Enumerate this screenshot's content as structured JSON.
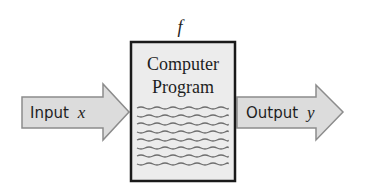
{
  "diagram": {
    "function_label": "f",
    "box": {
      "line1": "Computer",
      "line2": "Program",
      "code_lines": 8
    },
    "input_arrow": {
      "text": "Input",
      "variable": "x"
    },
    "output_arrow": {
      "text": "Output",
      "variable": "y"
    },
    "colors": {
      "arrow_fill": "#dcdcdc",
      "arrow_stroke": "#8c8c8c",
      "box_fill": "#ececec",
      "box_stroke": "#1a1a1a",
      "squiggle": "#6e6e6e"
    }
  }
}
